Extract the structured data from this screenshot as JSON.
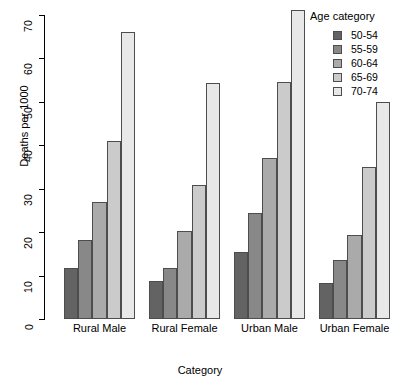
{
  "chart_data": {
    "type": "bar",
    "title": "",
    "xlabel": "Category",
    "ylabel": "Deaths per 1000",
    "categories": [
      "Rural Male",
      "Rural Female",
      "Urban Male",
      "Urban Female"
    ],
    "series": [
      {
        "name": "50-54",
        "color": "#636363",
        "values": [
          11.7,
          8.7,
          15.4,
          8.4
        ]
      },
      {
        "name": "55-59",
        "color": "#888888",
        "values": [
          18.1,
          11.7,
          24.3,
          13.6
        ]
      },
      {
        "name": "60-64",
        "color": "#aaaaaa",
        "values": [
          26.9,
          20.3,
          37.0,
          19.3
        ]
      },
      {
        "name": "65-69",
        "color": "#cbcbcb",
        "values": [
          41.0,
          30.9,
          54.6,
          35.1
        ]
      },
      {
        "name": "70-74",
        "color": "#e8e8e8",
        "values": [
          66.0,
          54.3,
          71.1,
          50.0
        ]
      }
    ],
    "ylim": [
      0,
      70
    ],
    "yticks": [
      0,
      10,
      20,
      30,
      40,
      50,
      60,
      70
    ],
    "ytick_labels": [
      "0",
      "10",
      "20",
      "30",
      "40",
      "50",
      "60",
      "70"
    ],
    "grid": false,
    "legend": {
      "title": "Age category",
      "position": "top-right",
      "entries": [
        "50-54",
        "55-59",
        "60-64",
        "65-69",
        "70-74"
      ]
    }
  }
}
